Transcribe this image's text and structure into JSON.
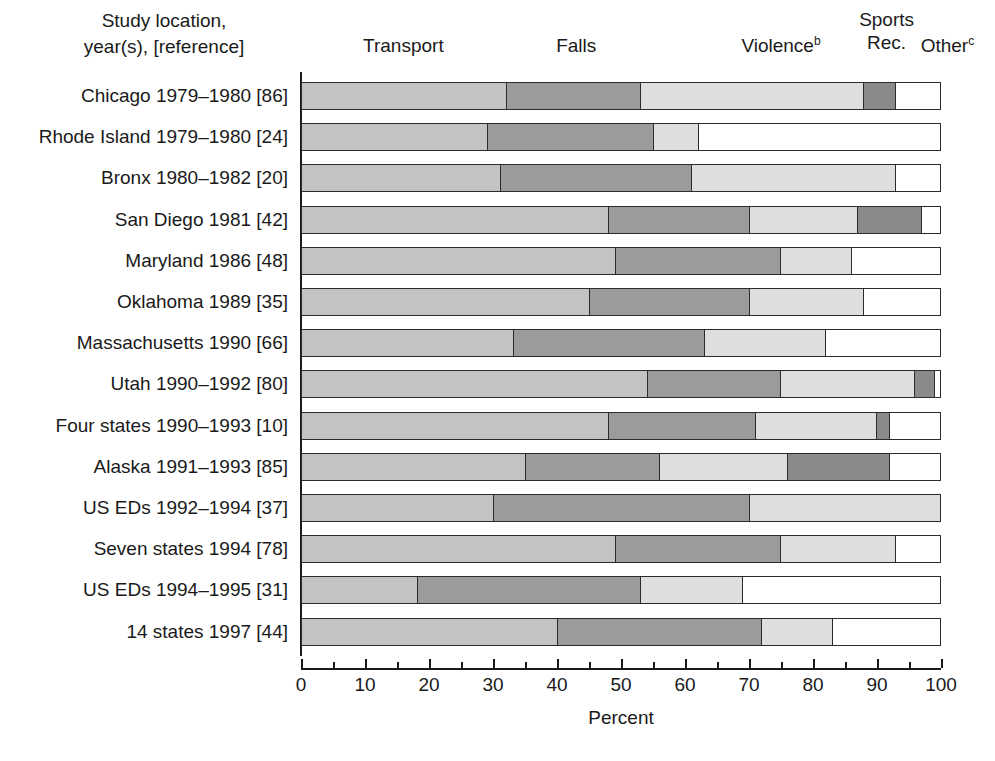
{
  "figure": {
    "row_header": "Study location,\nyear(s), [reference]",
    "xlabel": "Percent"
  },
  "chart_data": {
    "type": "bar",
    "orientation": "horizontal",
    "stacked": true,
    "title": "",
    "xlabel": "Percent",
    "ylabel": "Study location, year(s), [reference]",
    "xlim": [
      0,
      100
    ],
    "xticks": [
      0,
      10,
      20,
      30,
      40,
      50,
      60,
      70,
      80,
      90,
      100
    ],
    "xtick_labels": [
      "0",
      "10",
      "20",
      "30",
      "40",
      "50",
      "60",
      "70",
      "80",
      "90",
      "100"
    ],
    "minor_xticks": [
      5,
      15,
      25,
      35,
      45,
      55,
      65,
      75,
      85,
      95
    ],
    "grid": false,
    "legend_position": "top",
    "categories": [
      "Chicago 1979–1980 [86]",
      "Rhode Island 1979–1980 [24]",
      "Bronx 1980–1982 [20]",
      "San Diego 1981 [42]",
      "Maryland 1986 [48]",
      "Oklahoma 1989 [35]",
      "Massachusetts 1990 [66]",
      "Utah 1990–1992 [80]",
      "Four states 1990–1993 [10]",
      "Alaska 1991–1993 [85]",
      "US EDs 1992–1994 [37]",
      "Seven states 1994 [78]",
      "US EDs 1994–1995 [31]",
      "14 states 1997 [44]"
    ],
    "series": [
      {
        "name": "Transport",
        "key": "transport",
        "color": "#c3c3c3",
        "values": [
          32,
          29,
          31,
          48,
          49,
          45,
          33,
          54,
          48,
          35,
          30,
          49,
          18,
          40
        ]
      },
      {
        "name": "Falls",
        "key": "falls",
        "color": "#9b9b9b",
        "values": [
          21,
          26,
          30,
          22,
          26,
          25,
          30,
          21,
          23,
          21,
          40,
          26,
          35,
          32
        ]
      },
      {
        "name": "Violence",
        "key": "violence",
        "color": "#dedede",
        "values": [
          35,
          7,
          32,
          17,
          11,
          18,
          19,
          21,
          19,
          20,
          30,
          18,
          16,
          11
        ]
      },
      {
        "name": "Sports Rec.",
        "key": "sports",
        "color": "#8a8a8a",
        "values": [
          5,
          0,
          0,
          10,
          0,
          0,
          0,
          3,
          2,
          16,
          0,
          0,
          0,
          0
        ]
      },
      {
        "name": "Other",
        "key": "other",
        "color": "#ffffff",
        "values": [
          7,
          38,
          7,
          3,
          14,
          12,
          18,
          1,
          8,
          8,
          0,
          7,
          31,
          17
        ]
      }
    ]
  },
  "segment_headers": [
    {
      "label": "Transport",
      "sup": "",
      "center_percent": 16,
      "lines": 1
    },
    {
      "label": "Falls",
      "sup": "",
      "center_percent": 43,
      "lines": 1
    },
    {
      "label": "Violence",
      "sup": "b",
      "center_percent": 75,
      "lines": 1
    },
    {
      "label": "Sports\nRec.",
      "sup": "",
      "center_percent": 91.5,
      "lines": 2
    },
    {
      "label": "Other",
      "sup": "c",
      "center_percent": 101,
      "lines": 1
    }
  ]
}
